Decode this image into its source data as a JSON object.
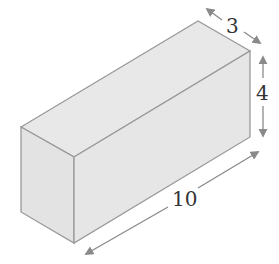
{
  "figure": {
    "type": "rectangular-prism",
    "colors": {
      "face_fill": "#e6e6e6",
      "edge": "#9a9a9a",
      "arrow": "#8a8a8a",
      "label": "#333333"
    }
  },
  "dimensions": {
    "depth": {
      "label": "3"
    },
    "height": {
      "label": "4"
    },
    "length": {
      "label": "10"
    }
  }
}
